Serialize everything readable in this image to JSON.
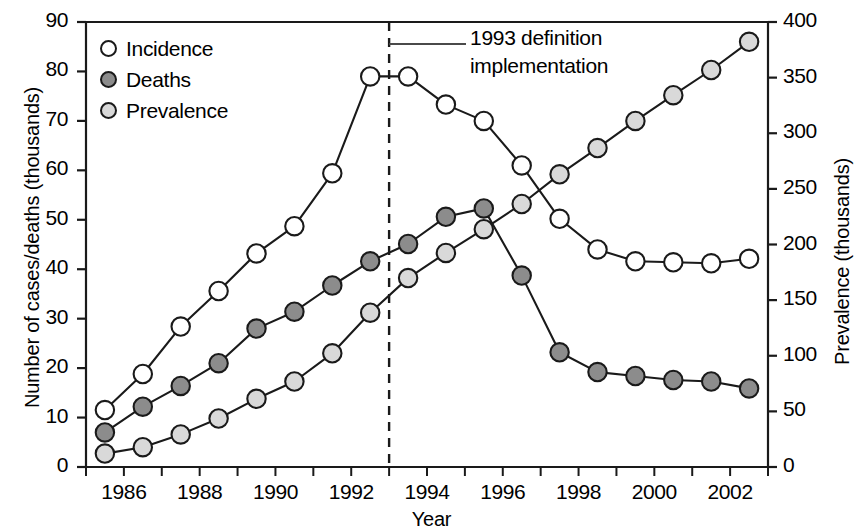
{
  "chart_data": {
    "type": "line",
    "title": "",
    "xlabel": "Year",
    "ylabel": "Number of cases/deaths (thousands)",
    "ylabel_secondary": "Prevalence (thousands)",
    "ylim": [
      0,
      90
    ],
    "ylim_secondary": [
      0,
      400
    ],
    "xlim": [
      1985,
      2003
    ],
    "grid": false,
    "legend_position": "top-left",
    "y_ticks": [
      "0",
      "10",
      "20",
      "30",
      "40",
      "50",
      "60",
      "70",
      "80",
      "90"
    ],
    "y_ticks_secondary": [
      "0",
      "50",
      "100",
      "150",
      "200",
      "250",
      "300",
      "350",
      "400"
    ],
    "x_ticks": [
      "1986",
      "1988",
      "1990",
      "1992",
      "1994",
      "1996",
      "1998",
      "2000",
      "2002"
    ],
    "x": [
      1985.5,
      1986.5,
      1987.5,
      1988.5,
      1989.5,
      1990.5,
      1991.5,
      1992.5,
      1993.5,
      1994.5,
      1995.5,
      1996.5,
      1997.5,
      1998.5,
      1999.5,
      2000.5,
      2001.5,
      2002.5
    ],
    "series": [
      {
        "name": "Incidence",
        "axis": "left",
        "marker": "open-circle",
        "fill": "#ffffff",
        "stroke": "#1a1a1a",
        "values": [
          11.5,
          18.8,
          28.4,
          35.6,
          43.2,
          48.7,
          59.4,
          79.0,
          79.0,
          73.3,
          70.0,
          61.0,
          50.2,
          44.0,
          41.6,
          41.4,
          41.2,
          42.1
        ]
      },
      {
        "name": "Deaths",
        "axis": "left",
        "marker": "filled-circle",
        "fill": "#8c8c8c",
        "stroke": "#1a1a1a",
        "values": [
          7.0,
          12.2,
          16.4,
          21.0,
          28.0,
          31.4,
          36.7,
          41.6,
          45.1,
          50.6,
          52.3,
          38.7,
          23.2,
          19.2,
          18.4,
          17.6,
          17.3,
          15.9
        ]
      },
      {
        "name": "Prevalence",
        "axis": "right",
        "marker": "filled-circle",
        "fill": "#d9d9d9",
        "stroke": "#1a1a1a",
        "values_left_scale": [
          2.7,
          4.0,
          6.6,
          9.8,
          13.8,
          17.3,
          23.0,
          31.2,
          38.2,
          43.3,
          48.1,
          53.2,
          59.2,
          64.5,
          70.0,
          75.2,
          80.3,
          86.0
        ],
        "values": [
          12,
          18,
          29,
          44,
          61,
          77,
          102,
          139,
          170,
          192,
          214,
          236,
          263,
          287,
          311,
          334,
          357,
          382
        ]
      }
    ],
    "annotations": [
      {
        "name": "definition-change",
        "text_line1": "1993 definition",
        "text_line2": "implementation",
        "x": 1993.0,
        "type": "vertical-dashed-line-with-label"
      }
    ]
  },
  "legend": {
    "items": [
      {
        "label": "Incidence",
        "swatch": "#ffffff"
      },
      {
        "label": "Deaths",
        "swatch": "#8c8c8c"
      },
      {
        "label": "Prevalence",
        "swatch": "#d9d9d9"
      }
    ]
  },
  "axes": {
    "left_title": "Number of cases/deaths (thousands)",
    "right_title": "Prevalence (thousands)",
    "x_title": "Year"
  }
}
